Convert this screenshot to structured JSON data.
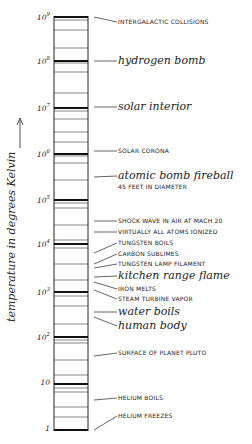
{
  "diagram": {
    "axis_label": "temperature in degrees Kelvin",
    "axis_arrow_icon": "up-arrow",
    "colors": {
      "ink": "#222222",
      "background": "#ffffff"
    },
    "ticks": [
      {
        "base": "10",
        "exp": "9",
        "y": 17
      },
      {
        "base": "10",
        "exp": "8",
        "y": 61
      },
      {
        "base": "10",
        "exp": "7",
        "y": 108
      },
      {
        "base": "10",
        "exp": "6",
        "y": 154
      },
      {
        "base": "10",
        "exp": "5",
        "y": 200
      },
      {
        "base": "10",
        "exp": "4",
        "y": 244
      },
      {
        "base": "10",
        "exp": "3",
        "y": 292
      },
      {
        "base": "10",
        "exp": "2",
        "y": 337
      },
      {
        "base": "10",
        "exp": "",
        "y": 384
      },
      {
        "base": "1",
        "exp": "",
        "y": 430
      }
    ],
    "labels": [
      {
        "text": "INTERGALACTIC COLLISIONS",
        "style": "caps",
        "y": 22,
        "from_y": 17
      },
      {
        "text": "hydrogen bomb",
        "style": "script",
        "y": 61,
        "from_y": 61
      },
      {
        "text": "solar interior",
        "style": "script",
        "y": 107,
        "from_y": 107
      },
      {
        "text": "SOLAR CORONA",
        "style": "caps",
        "y": 151,
        "from_y": 151
      },
      {
        "text": "atomic bomb fireball",
        "style": "script",
        "y": 176,
        "from_y": 177
      },
      {
        "text": "45 FEET IN DIAMETER",
        "style": "caps",
        "y": 187,
        "from_y": null
      },
      {
        "text": "SHOCK WAVE IN AIR AT MACH 20",
        "style": "caps",
        "y": 221,
        "from_y": 221
      },
      {
        "text": "VIRTUALLY ALL ATOMS IONIZED",
        "style": "caps",
        "y": 232,
        "from_y": 232
      },
      {
        "text": "TUNGSTEN BOILS",
        "style": "caps",
        "y": 243,
        "from_y": 253
      },
      {
        "text": "CARBON SUBLIMES",
        "style": "caps",
        "y": 254,
        "from_y": 264
      },
      {
        "text": "TUNGSTEN LAMP FILAMENT",
        "style": "caps",
        "y": 264,
        "from_y": 268
      },
      {
        "text": "kitchen range flame",
        "style": "script",
        "y": 276,
        "from_y": 277
      },
      {
        "text": "IRON MELTS",
        "style": "caps",
        "y": 289,
        "from_y": 282
      },
      {
        "text": "STEAM TURBINE VAPOR",
        "style": "caps",
        "y": 299,
        "from_y": 290
      },
      {
        "text": "water boils",
        "style": "script",
        "y": 312,
        "from_y": 312
      },
      {
        "text": "human body",
        "style": "script",
        "y": 326,
        "from_y": 317
      },
      {
        "text": "SURFACE OF PLANET PLUTO",
        "style": "caps",
        "y": 353,
        "from_y": 356
      },
      {
        "text": "HELIUM BOILS",
        "style": "caps",
        "y": 398,
        "from_y": 400
      },
      {
        "text": "HELIUM FREEZES",
        "style": "caps",
        "y": 416,
        "from_y": 430
      }
    ],
    "minor_lines_y": [
      20,
      30,
      48,
      63,
      72,
      93,
      111,
      119,
      132,
      142,
      156,
      163,
      180,
      203,
      208,
      225,
      240,
      248,
      264,
      280,
      296,
      306,
      324,
      340,
      343,
      360,
      375,
      388,
      392,
      407,
      417
    ]
  }
}
